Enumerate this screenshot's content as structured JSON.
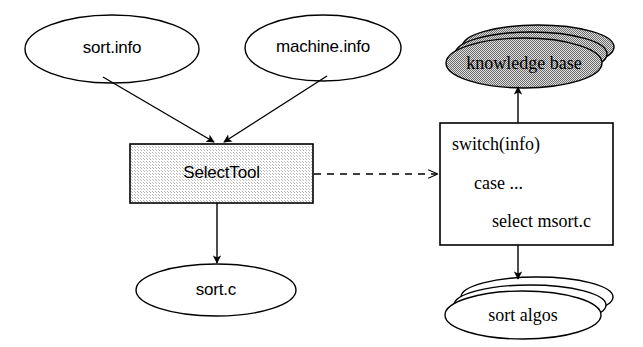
{
  "diagram": {
    "nodes": {
      "sort_info": {
        "label": "sort.info",
        "shape": "ellipse",
        "fill": "#ffffff"
      },
      "machine_info": {
        "label": "machine.info",
        "shape": "ellipse",
        "fill": "#ffffff"
      },
      "select_tool": {
        "label": "SelectTool",
        "shape": "rectangle",
        "fill": "#e9e9e9"
      },
      "sort_c": {
        "label": "sort.c",
        "shape": "ellipse",
        "fill": "#ffffff"
      },
      "knowledge_base": {
        "label": "knowledge base",
        "shape": "ellipse-stack",
        "fill": "#b4b4b4"
      },
      "sort_algos": {
        "label": "sort algos",
        "shape": "ellipse-stack",
        "fill": "#ffffff"
      },
      "switch_box": {
        "shape": "rectangle",
        "fill": "#ffffff",
        "lines": [
          "switch(info)",
          "case ...",
          "select msort.c"
        ]
      }
    },
    "edges": [
      {
        "from": "sort_info",
        "to": "select_tool",
        "style": "solid",
        "arrow": "filled"
      },
      {
        "from": "machine_info",
        "to": "select_tool",
        "style": "solid",
        "arrow": "filled"
      },
      {
        "from": "select_tool",
        "to": "sort_c",
        "style": "solid",
        "arrow": "filled"
      },
      {
        "from": "select_tool",
        "to": "switch_box",
        "style": "dashed",
        "arrow": "open"
      },
      {
        "from": "switch_box",
        "to": "knowledge_base",
        "style": "solid",
        "arrow": "filled"
      },
      {
        "from": "switch_box",
        "to": "sort_algos",
        "style": "solid",
        "arrow": "filled"
      }
    ],
    "colors": {
      "stroke": "#000000",
      "background": "#ffffff",
      "box_fill": "#e9e9e9",
      "kb_fill": "#b4b4b4"
    }
  }
}
